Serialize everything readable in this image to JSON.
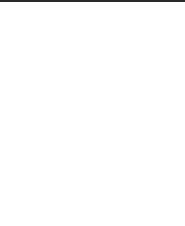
{
  "row_label": {
    "text": "8 tr",
    "row": 0
  },
  "grid": {
    "columns_x": [
      13,
      42,
      71,
      100,
      128,
      158
    ],
    "rows_y": [
      25,
      66,
      104,
      142,
      180,
      215
    ],
    "marker_rows_y": [
      45,
      84,
      121,
      162
    ]
  },
  "markers": [
    {
      "row": 0,
      "col": 0,
      "type": "dot"
    },
    {
      "row": 0,
      "col": 1,
      "type": "square"
    },
    {
      "row": 0,
      "col": 2,
      "type": "dot"
    },
    {
      "row": 0,
      "col": 3,
      "type": "dot"
    },
    {
      "row": 0,
      "col": 4,
      "type": "dot"
    },
    {
      "row": 0,
      "col": 5,
      "type": "dot"
    },
    {
      "row": 1,
      "col": 0,
      "type": "dot"
    },
    {
      "row": 1,
      "col": 4,
      "type": "dot"
    },
    {
      "row": 1,
      "col": 5,
      "type": "dot"
    },
    {
      "row": 2,
      "col": 1,
      "type": "dot"
    },
    {
      "row": 2,
      "col": 2,
      "type": "dot"
    },
    {
      "row": 2,
      "col": 3,
      "type": "square"
    },
    {
      "row": 3,
      "col": 0,
      "type": "dot"
    },
    {
      "row": 3,
      "col": 1,
      "type": "dot"
    },
    {
      "row": 3,
      "col": 2,
      "type": "dot"
    },
    {
      "row": 3,
      "col": 4,
      "type": "dot"
    },
    {
      "row": 3,
      "col": 5,
      "type": "dot"
    }
  ],
  "legend": {
    "dot": "filled-circle-marker",
    "square": "open-square-marker"
  }
}
